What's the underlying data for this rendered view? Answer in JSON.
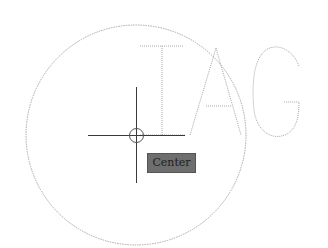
{
  "viewport": {
    "background": "#ffffff",
    "line_color": "#a8a8a8",
    "geometry": {
      "circle": {
        "cx": 136,
        "cy": 135,
        "r": 110
      },
      "letters": [
        "I",
        "A",
        "G"
      ]
    }
  },
  "cursor": {
    "type": "crosshair",
    "x": 136,
    "y": 135,
    "color": "#3a3a3a"
  },
  "snap": {
    "marker": "center-snap-marker",
    "tooltip_label": "Center",
    "tooltip_bg": "#6e6e6e"
  }
}
